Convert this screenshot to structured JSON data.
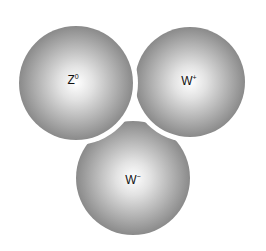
{
  "diagram": {
    "title": "",
    "particles": [
      {
        "id": "z0",
        "symbol": "Z",
        "charge": "0",
        "cx": 76,
        "cy": 83,
        "r": 57
      },
      {
        "id": "wplus",
        "symbol": "W",
        "charge": "+",
        "cx": 190,
        "cy": 82,
        "r": 55
      },
      {
        "id": "wminus",
        "symbol": "W",
        "charge": "−",
        "cx": 133,
        "cy": 178,
        "r": 57
      }
    ],
    "colors": {
      "sphere_center": "#ffffff",
      "sphere_edge": "#8a8a8a",
      "background": "#ffffff"
    }
  }
}
